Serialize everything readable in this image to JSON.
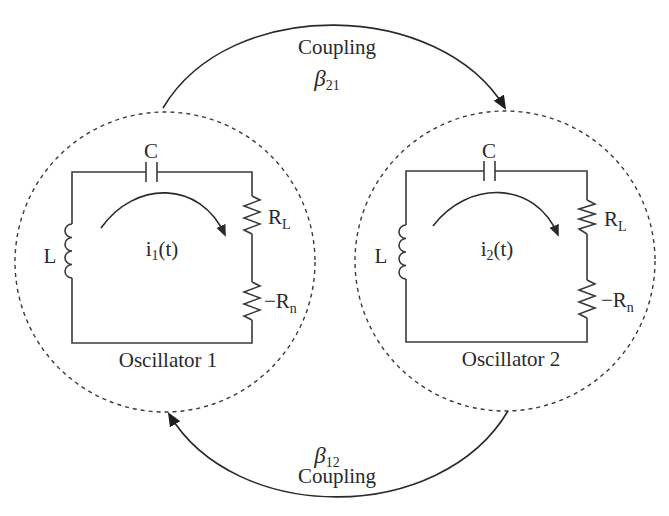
{
  "diagram": {
    "type": "coupled-oscillators-circuit",
    "colors": {
      "line": "#3a3a3a",
      "text": "#2a2a2a",
      "background": "#ffffff"
    }
  },
  "coupling_top": {
    "label": "Coupling",
    "symbol": "β",
    "subscript": "21",
    "direction": "oscillator-1-to-oscillator-2"
  },
  "coupling_bottom": {
    "label": "Coupling",
    "symbol": "β",
    "subscript": "12",
    "direction": "oscillator-2-to-oscillator-1"
  },
  "oscillators": [
    {
      "name": "Oscillator 1",
      "capacitor": "C",
      "inductor": "L",
      "load_resistor": {
        "main": "R",
        "sub": "L"
      },
      "negative_resistor": {
        "main": "−R",
        "sub": "n"
      },
      "current": {
        "main": "i",
        "sub": "1",
        "suffix": "(t)"
      }
    },
    {
      "name": "Oscillator 2",
      "capacitor": "C",
      "inductor": "L",
      "load_resistor": {
        "main": "R",
        "sub": "L"
      },
      "negative_resistor": {
        "main": "−R",
        "sub": "n"
      },
      "current": {
        "main": "i",
        "sub": "2",
        "suffix": "(t)"
      }
    }
  ]
}
